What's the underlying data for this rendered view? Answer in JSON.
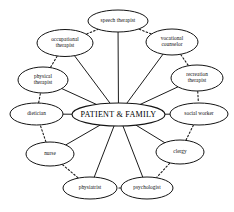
{
  "diagram": {
    "title": "PATIENT & FAMILY",
    "background_color": "#ffffff",
    "line_color": "#1b1b1b",
    "node_fill": "#ffffff",
    "node_stroke": "#141414",
    "center": {
      "label": "PATIENT & FAMILY",
      "cx": 118.5,
      "cy": 114.5,
      "rx": 46.5,
      "ry": 11.5
    },
    "nodes": [
      {
        "id": "speech-therapist",
        "label": "speech therapist",
        "lines": [
          "speech therapist"
        ],
        "cx": 118.0,
        "cy": 21.0,
        "rx": 30.0,
        "ry": 11.0
      },
      {
        "id": "vocational-counselor",
        "label": "vocational counselor",
        "lines": [
          "vocational",
          "counselor"
        ],
        "cx": 172.0,
        "cy": 42.0,
        "rx": 26.0,
        "ry": 13.0
      },
      {
        "id": "recreation-therapist",
        "label": "recreation therapist",
        "lines": [
          "recreation",
          "therapist"
        ],
        "cx": 197.0,
        "cy": 78.0,
        "rx": 26.0,
        "ry": 13.0
      },
      {
        "id": "social-worker",
        "label": "social worker",
        "lines": [
          "social worker"
        ],
        "cx": 199.0,
        "cy": 114.0,
        "rx": 29.0,
        "ry": 11.0
      },
      {
        "id": "clergy",
        "label": "clergy",
        "lines": [
          "clergy"
        ],
        "cx": 180.0,
        "cy": 152.0,
        "rx": 24.0,
        "ry": 12.0
      },
      {
        "id": "psychologist",
        "label": "psychologist",
        "lines": [
          "psychologist"
        ],
        "cx": 147.0,
        "cy": 188.0,
        "rx": 26.0,
        "ry": 11.0
      },
      {
        "id": "physiatrist",
        "label": "physiatrist",
        "lines": [
          "physiatrist"
        ],
        "cx": 90.0,
        "cy": 188.0,
        "rx": 27.0,
        "ry": 11.0
      },
      {
        "id": "nurse",
        "label": "nurse",
        "lines": [
          "nurse"
        ],
        "cx": 50.0,
        "cy": 154.0,
        "rx": 24.0,
        "ry": 12.0
      },
      {
        "id": "dietician",
        "label": "dietician",
        "lines": [
          "dietician"
        ],
        "cx": 36.5,
        "cy": 114.0,
        "rx": 26.5,
        "ry": 11.0
      },
      {
        "id": "physical-therapist",
        "label": "physical therapist",
        "lines": [
          "physical",
          "therapist"
        ],
        "cx": 43.0,
        "cy": 80.0,
        "rx": 25.0,
        "ry": 13.0
      },
      {
        "id": "occupational-therapist",
        "label": "occupational therapist",
        "lines": [
          "occupational",
          "therapist"
        ],
        "cx": 65.0,
        "cy": 43.0,
        "rx": 28.0,
        "ry": 13.5
      }
    ],
    "extra_nodes": [],
    "spokes": [
      {
        "from": "center",
        "to": "speech-therapist"
      },
      {
        "from": "center",
        "to": "vocational-counselor"
      },
      {
        "from": "center",
        "to": "recreation-therapist"
      },
      {
        "from": "center",
        "to": "social-worker"
      },
      {
        "from": "center",
        "to": "clergy"
      },
      {
        "from": "center",
        "to": "psychologist"
      },
      {
        "from": "center",
        "to": "physiatrist"
      },
      {
        "from": "center",
        "to": "nurse"
      },
      {
        "from": "center",
        "to": "dietician"
      },
      {
        "from": "center",
        "to": "physical-therapist"
      },
      {
        "from": "center",
        "to": "occupational-therapist"
      }
    ],
    "ring_links": [
      {
        "from": "occupational-therapist",
        "to": "speech-therapist"
      },
      {
        "from": "speech-therapist",
        "to": "vocational-counselor"
      },
      {
        "from": "vocational-counselor",
        "to": "recreation-therapist"
      },
      {
        "from": "recreation-therapist",
        "to": "social-worker"
      },
      {
        "from": "social-worker",
        "to": "clergy"
      },
      {
        "from": "clergy",
        "to": "psychologist"
      },
      {
        "from": "psychologist",
        "to": "physiatrist"
      },
      {
        "from": "physiatrist",
        "to": "nurse"
      },
      {
        "from": "nurse",
        "to": "dietician"
      },
      {
        "from": "dietician",
        "to": "physical-therapist"
      },
      {
        "from": "physical-therapist",
        "to": "occupational-therapist"
      }
    ]
  }
}
